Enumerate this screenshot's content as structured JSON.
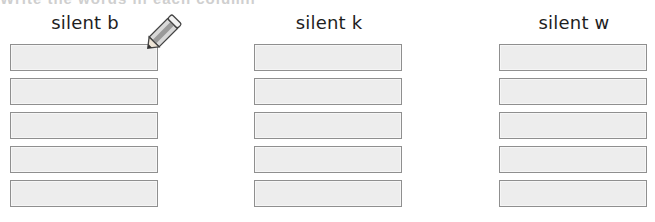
{
  "worksheet": {
    "clipped_title": "Write the words in each column",
    "columns": [
      {
        "heading": "silent b",
        "boxes": [
          "",
          "",
          "",
          "",
          ""
        ]
      },
      {
        "heading": "silent k",
        "boxes": [
          "",
          "",
          "",
          "",
          ""
        ]
      },
      {
        "heading": "silent w",
        "boxes": [
          "",
          "",
          "",
          "",
          ""
        ]
      }
    ]
  },
  "colors": {
    "box_fill": "#ededed",
    "box_border": "#8f8f8f",
    "heading_text": "#1e1e1e"
  },
  "icons": {
    "pencil": "pencil-icon"
  }
}
